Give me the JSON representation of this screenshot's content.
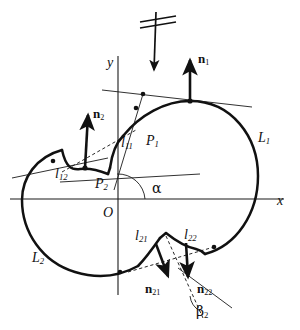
{
  "figure": {
    "background_color": "#ffffff",
    "stroke_color": "#111111",
    "curve_color": "#111111",
    "thin_line_color": "#222222"
  },
  "axes": {
    "x_label": "x",
    "y_label": "y",
    "origin_label": "O"
  },
  "curves": [
    {
      "name": "L1",
      "label": "L",
      "subscript": "1",
      "description": "large right lobe curve"
    },
    {
      "name": "L2",
      "label": "L",
      "subscript": "2",
      "description": "large left lobe curve"
    }
  ],
  "points": [
    {
      "name": "P1",
      "label": "P",
      "subscript": "1"
    },
    {
      "name": "P2",
      "label": "P",
      "subscript": "2"
    }
  ],
  "arcs": [
    {
      "name": "l11",
      "label": "l",
      "subscript": "11"
    },
    {
      "name": "l12",
      "label": "l",
      "subscript": "12"
    },
    {
      "name": "l21",
      "label": "l",
      "subscript": "21"
    },
    {
      "name": "l22",
      "label": "l",
      "subscript": "22"
    }
  ],
  "normals": [
    {
      "name": "n1",
      "label": "n",
      "subscript": "1",
      "direction": "up"
    },
    {
      "name": "n2",
      "label": "n",
      "subscript": "2",
      "direction": "up"
    },
    {
      "name": "n21",
      "label": "n",
      "subscript": "21",
      "direction": "down"
    },
    {
      "name": "n22",
      "label": "n",
      "subscript": "22",
      "direction": "down"
    }
  ],
  "angles": [
    {
      "name": "alpha",
      "label": "α"
    },
    {
      "name": "beta2",
      "label": "β",
      "subscript": "2"
    }
  ],
  "incident_arrow": {
    "name": "incident-direction-arrow",
    "description": "downward arrow with two slanted double-strike marks at top of figure"
  }
}
